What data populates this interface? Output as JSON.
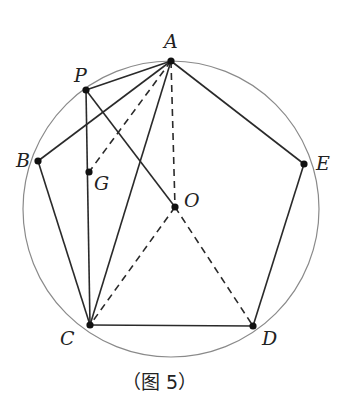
{
  "diagram": {
    "caption": "（图 5）",
    "circle": {
      "cx": 171,
      "cy": 209,
      "r": 148,
      "color": "#8a8a8a"
    },
    "points": [
      {
        "name": "A",
        "x": 171,
        "y": 61,
        "lx": 164,
        "ly": 48
      },
      {
        "name": "P",
        "x": 86,
        "y": 90,
        "lx": 74,
        "ly": 82
      },
      {
        "name": "B",
        "x": 38,
        "y": 161,
        "lx": 16,
        "ly": 167
      },
      {
        "name": "G",
        "x": 89,
        "y": 172,
        "lx": 94,
        "ly": 190
      },
      {
        "name": "O",
        "x": 175,
        "y": 207,
        "lx": 184,
        "ly": 207
      },
      {
        "name": "E",
        "x": 304,
        "y": 164,
        "lx": 316,
        "ly": 170
      },
      {
        "name": "C",
        "x": 90,
        "y": 325,
        "lx": 60,
        "ly": 345
      },
      {
        "name": "D",
        "x": 253,
        "y": 326,
        "lx": 262,
        "ly": 345
      }
    ],
    "solid_segments": [
      [
        "A",
        "P"
      ],
      [
        "A",
        "B"
      ],
      [
        "A",
        "C"
      ],
      [
        "P",
        "O"
      ],
      [
        "P",
        "C"
      ],
      [
        "B",
        "C"
      ],
      [
        "C",
        "D"
      ],
      [
        "D",
        "E"
      ],
      [
        "E",
        "A"
      ]
    ],
    "dashed_segments": [
      [
        "A",
        "G"
      ],
      [
        "A",
        "O"
      ],
      [
        "O",
        "C"
      ],
      [
        "O",
        "D"
      ]
    ],
    "colors": {
      "line": "#2a2a2a",
      "point": "#111111"
    }
  }
}
